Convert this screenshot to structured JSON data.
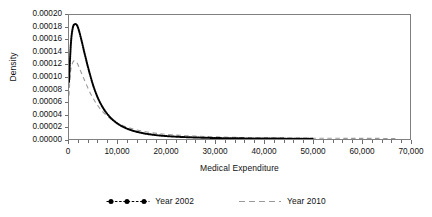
{
  "chart_data": {
    "type": "line",
    "title": "",
    "xlabel": "Medical Expenditure",
    "ylabel": "Density",
    "xlim": [
      0,
      70000
    ],
    "ylim": [
      0,
      0.0002
    ],
    "grid": false,
    "legend_position": "bottom",
    "xticks": [
      0,
      10000,
      20000,
      30000,
      40000,
      50000,
      60000,
      70000
    ],
    "xticklabels": [
      "0",
      "10,000",
      "20,000",
      "30,000",
      "40,000",
      "50,000",
      "60,000",
      "70,000"
    ],
    "x_minor_tick_interval": 2000,
    "yticks": [
      0.0,
      2e-05,
      4e-05,
      6e-05,
      8e-05,
      0.0001,
      0.00012,
      0.00014,
      0.00016,
      0.00018,
      0.0002
    ],
    "yticklabels": [
      "0.00000",
      "0.00002",
      "0.00004",
      "0.00006",
      "0.00008",
      "0.00010",
      "0.00012",
      "0.00014",
      "0.00016",
      "0.00018",
      "0.00020"
    ],
    "series": [
      {
        "name": "Year 2002",
        "color": "#000000",
        "style": "dotted-marker",
        "peak_x": 1600,
        "peak_y": 0.000185,
        "x_end": 50000,
        "x": [
          0,
          400,
          800,
          1200,
          1600,
          2000,
          2600,
          3200,
          4000,
          5000,
          6000,
          7000,
          8000,
          9000,
          10000,
          11000,
          12000,
          13000,
          14000,
          15000,
          16000,
          18000,
          20000,
          22000,
          25000,
          30000,
          35000,
          40000,
          45000,
          50000
        ],
        "y": [
          9.2e-05,
          0.000155,
          0.00018,
          0.000185,
          0.000184,
          0.000176,
          0.000158,
          0.000138,
          0.000113,
          8.55e-05,
          6.5e-05,
          5e-05,
          3.9e-05,
          3.08e-05,
          2.46e-05,
          2e-05,
          1.64e-05,
          1.36e-05,
          1.14e-05,
          9.6e-06,
          8.2e-06,
          6.1e-06,
          4.7e-06,
          3.7e-06,
          2.7e-06,
          1.6e-06,
          1.1e-06,
          8e-07,
          6e-07,
          5e-07
        ]
      },
      {
        "name": "Year 2010",
        "color": "#9a9a9a",
        "style": "dashed",
        "peak_x": 1300,
        "peak_y": 0.000126,
        "x_end": 67000,
        "x": [
          0,
          300,
          700,
          1000,
          1300,
          1700,
          2200,
          2800,
          3500,
          4500,
          5500,
          6500,
          8000,
          9500,
          11000,
          12500,
          14000,
          16000,
          18000,
          20000,
          23000,
          26000,
          30000,
          35000,
          40000,
          45000,
          50000,
          55000,
          60000,
          67000
        ],
        "y": [
          7e-05,
          0.000108,
          0.000122,
          0.000126,
          0.000126,
          0.000122,
          0.000113,
          0.000102,
          8.9e-05,
          7.2e-05,
          5.85e-05,
          4.78e-05,
          3.6e-05,
          2.78e-05,
          2.19e-05,
          1.76e-05,
          1.44e-05,
          1.13e-05,
          9.1e-06,
          7.5e-06,
          5.8e-06,
          4.6e-06,
          3.5e-06,
          2.5e-06,
          1.9e-06,
          1.5e-06,
          1.3e-06,
          1.1e-06,
          1e-06,
          9e-07
        ]
      }
    ]
  },
  "legend": {
    "items": [
      {
        "label": "Year 2002"
      },
      {
        "label": "Year 2010"
      }
    ]
  }
}
